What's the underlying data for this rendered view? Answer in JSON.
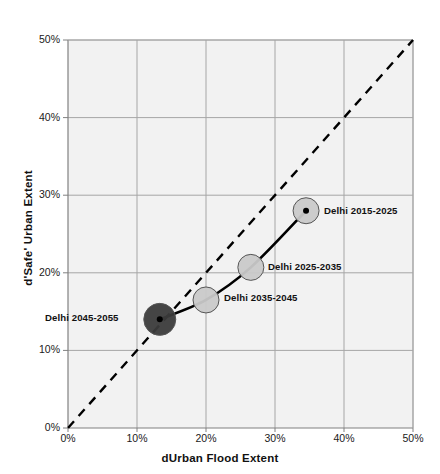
{
  "chart_data": {
    "type": "scatter",
    "title": "",
    "xlabel": "dUrban Flood Extent",
    "ylabel": "d'Safe' Urban Extent",
    "xlim": [
      0,
      50
    ],
    "ylim": [
      0,
      50
    ],
    "grid": true,
    "legend": "none",
    "x_tick_labels": [
      "0%",
      "10%",
      "20%",
      "30%",
      "40%",
      "50%"
    ],
    "y_tick_labels": [
      "0%",
      "10%",
      "20%",
      "30%",
      "40%",
      "50%"
    ],
    "x_ticks": [
      0,
      10,
      20,
      30,
      40,
      50
    ],
    "y_ticks": [
      0,
      10,
      20,
      30,
      40,
      50
    ],
    "series": [
      {
        "name": "Delhi trajectory",
        "connected": true,
        "line_style": "solid",
        "line_color": "#000000",
        "points": [
          {
            "label": "Delhi 2015-2025",
            "x": 34.5,
            "y": 28.0,
            "marker_color": "#c9c9c9",
            "marker_radius_px": 13,
            "label_side": "right"
          },
          {
            "label": "Delhi 2025-2035",
            "x": 26.5,
            "y": 20.7,
            "marker_color": "#c9c9c9",
            "marker_radius_px": 13,
            "label_side": "right"
          },
          {
            "label": "Delhi 2035-2045",
            "x": 20.0,
            "y": 16.5,
            "marker_color": "#c9c9c9",
            "marker_radius_px": 13,
            "label_side": "right"
          },
          {
            "label": "Delhi 2045-2055",
            "x": 13.3,
            "y": 14.0,
            "marker_color": "#3b3b3b",
            "marker_radius_px": 16,
            "label_side": "left"
          }
        ]
      },
      {
        "name": "1:1 reference line",
        "connected": true,
        "line_style": "dashed",
        "line_color": "#000000",
        "points": [
          {
            "label": "",
            "x": 0,
            "y": 0
          },
          {
            "label": "",
            "x": 50,
            "y": 50
          }
        ]
      }
    ],
    "colors": {
      "plot_background": "#f2f2f2",
      "gridline": "#a6a6a6",
      "axis_line": "#808080",
      "text": "#111111"
    }
  }
}
